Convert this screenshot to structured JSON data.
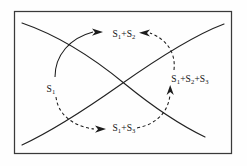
{
  "figure": {
    "type": "schematic-diagram",
    "background_color": "#fefefe",
    "frame": {
      "name": "outer-border",
      "stroke_color": "#3a3a3a",
      "x": 14,
      "y": 11,
      "width": 218,
      "height": 143
    },
    "labels": [
      {
        "id": "label-s1",
        "position": "left",
        "base": "S",
        "sub1": "1",
        "text": "S1",
        "x": 51,
        "y": 89
      },
      {
        "id": "label-s1-s2",
        "position": "top",
        "base": "S",
        "sub1": "1",
        "plus": "+S",
        "sub2": "2",
        "text": "S1+S2",
        "x": 108,
        "y": 37
      },
      {
        "id": "label-s1-s3",
        "position": "bottom",
        "base": "S",
        "sub1": "1",
        "plus": "+S",
        "sub2": "3",
        "text": "S1+S3",
        "x": 108,
        "y": 131
      },
      {
        "id": "label-s1-s2-s3",
        "position": "right",
        "base": "S",
        "sub1": "1",
        "plus": "+S",
        "sub2": "2",
        "plus2": "+S",
        "sub3": "3",
        "text": "S1+S2+S3",
        "x": 158,
        "y": 85
      }
    ],
    "curves": [
      {
        "id": "descending-curve",
        "style": "solid",
        "description": "solid curve descending from upper-left to lower-right"
      },
      {
        "id": "ascending-curve",
        "style": "solid",
        "description": "solid curve ascending from lower-left to upper-right"
      }
    ],
    "flow_arcs": [
      {
        "id": "arc-s1-to-s1s2",
        "style": "solid",
        "from": "S1",
        "to": "S1+S2",
        "direction": "counterclockwise-up",
        "arrowhead": "end"
      },
      {
        "id": "arc-s1-to-s1s3",
        "style": "dashed",
        "from": "S1",
        "to": "S1+S3",
        "direction": "clockwise-down",
        "arrowhead": "end"
      },
      {
        "id": "arc-s1s3-to-s1s2s3",
        "style": "dashed",
        "from": "S1+S3",
        "to": "S1+S2+S3",
        "direction": "up-right",
        "arrowhead": "end"
      },
      {
        "id": "arc-s1s2s3-to-s1s2",
        "style": "dashed",
        "from": "S1+S2+S3",
        "to": "S1+S2",
        "direction": "up-left",
        "arrowhead": "end"
      }
    ]
  }
}
